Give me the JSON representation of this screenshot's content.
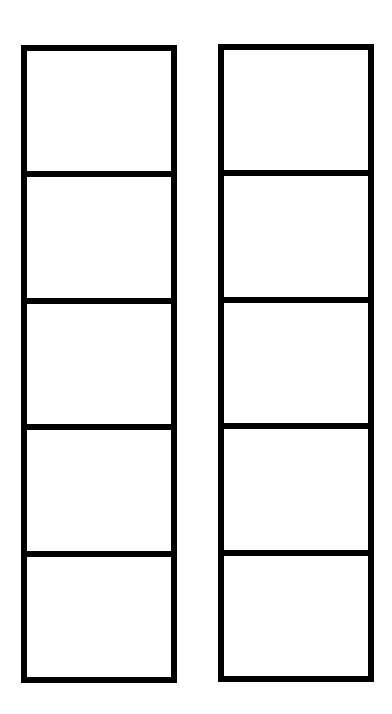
{
  "diagram": {
    "type": "empty-box-columns",
    "columns": [
      {
        "id": "left",
        "cells": [
          "",
          "",
          "",
          "",
          ""
        ]
      },
      {
        "id": "right",
        "cells": [
          "",
          "",
          "",
          "",
          ""
        ]
      }
    ],
    "line_color": "#000000",
    "background": "#ffffff"
  }
}
